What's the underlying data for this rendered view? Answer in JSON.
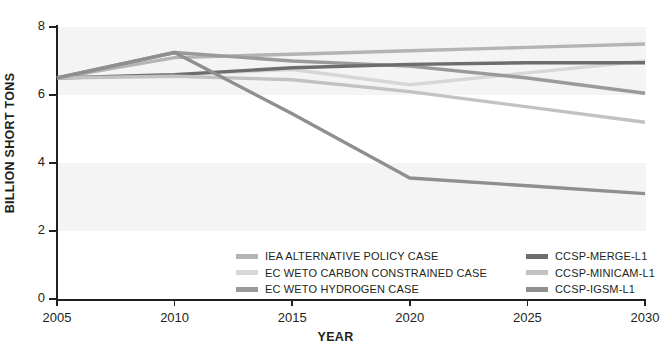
{
  "chart_data": {
    "type": "line",
    "title": "",
    "xlabel": "YEAR",
    "ylabel": "BILLION SHORT TONS",
    "xlim": [
      2005,
      2030
    ],
    "ylim": [
      0,
      8
    ],
    "xticks": [
      2005,
      2010,
      2015,
      2020,
      2025,
      2030
    ],
    "yticks": [
      0,
      2,
      4,
      6,
      8
    ],
    "grid": false,
    "legend_position": "bottom-center",
    "x": [
      2005,
      2010,
      2015,
      2020,
      2025,
      2030
    ],
    "series": [
      {
        "name": "IEA ALTERNATIVE POLICY CASE",
        "color": "#b4b4b4",
        "values": [
          6.5,
          7.1,
          7.2,
          7.3,
          7.4,
          7.5
        ]
      },
      {
        "name": "EC WETO CARBON CONSTRAINED CASE",
        "color": "#d7d7d7",
        "values": [
          6.5,
          6.6,
          6.75,
          6.3,
          6.65,
          7.0
        ]
      },
      {
        "name": "EC WETO HYDROGEN CASE",
        "color": "#9a9a9a",
        "values": [
          6.5,
          7.25,
          7.0,
          6.85,
          6.5,
          6.05
        ]
      },
      {
        "name": "CCSP-MERGE-L1",
        "color": "#6d6d6d",
        "values": [
          6.5,
          6.6,
          6.8,
          6.9,
          6.95,
          6.95
        ]
      },
      {
        "name": "CCSP-MINICAM-L1",
        "color": "#c2c2c2",
        "values": [
          6.5,
          6.55,
          6.45,
          6.1,
          5.65,
          5.2
        ]
      },
      {
        "name": "CCSP-IGSM-L1",
        "color": "#8f8f8f",
        "values": [
          6.5,
          7.25,
          5.45,
          3.56,
          3.33,
          3.1
        ]
      }
    ]
  },
  "axes": {
    "y_title": "BILLION SHORT TONS",
    "x_title": "YEAR",
    "y_tick_labels": [
      "8",
      "6",
      "4",
      "2",
      "0"
    ],
    "x_tick_labels": [
      "2005",
      "2010",
      "2015",
      "2020",
      "2025",
      "2030"
    ]
  },
  "legend": {
    "left_column": [
      {
        "label": "IEA ALTERNATIVE POLICY CASE",
        "color": "#b4b4b4"
      },
      {
        "label": "EC WETO CARBON CONSTRAINED CASE",
        "color": "#d7d7d7"
      },
      {
        "label": "EC WETO HYDROGEN CASE",
        "color": "#9a9a9a"
      }
    ],
    "right_column": [
      {
        "label": "CCSP-MERGE-L1",
        "color": "#6d6d6d"
      },
      {
        "label": "CCSP-MINICAM-L1",
        "color": "#c2c2c2"
      },
      {
        "label": "CCSP-IGSM-L1",
        "color": "#8f8f8f"
      }
    ]
  },
  "style": {
    "background": "#ffffff",
    "band_color": "#f4f4f4",
    "axis_color": "#231f20"
  }
}
